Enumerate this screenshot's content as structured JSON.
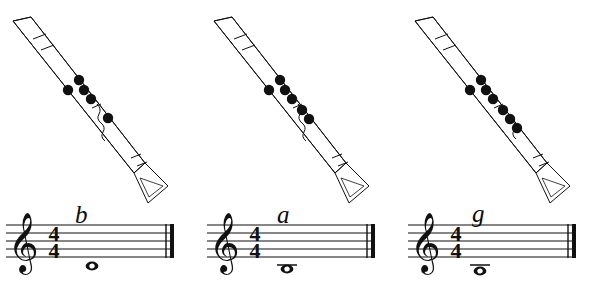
{
  "figure": {
    "background_color": "#ffffff",
    "ink_color": "#111111",
    "panel_count": 3
  },
  "panels": [
    {
      "id": "panel-b",
      "note_letter": "b",
      "staff": {
        "clef": "treble-clef",
        "time_signature_top": "4",
        "time_signature_bottom": "4",
        "note_duration": "whole",
        "note_position": "below-staff",
        "ledger_lines": 0,
        "barline": "final-barline"
      },
      "instrument": {
        "name": "clarinet",
        "covered_hole_count": 5,
        "holes": [
          {
            "id": "thumb",
            "covered": true
          },
          {
            "id": "left-1",
            "covered": true
          },
          {
            "id": "left-2",
            "covered": true
          },
          {
            "id": "left-3",
            "covered": true
          },
          {
            "id": "right-1",
            "covered": true
          }
        ]
      }
    },
    {
      "id": "panel-a",
      "note_letter": "a",
      "staff": {
        "clef": "treble-clef",
        "time_signature_top": "4",
        "time_signature_bottom": "4",
        "note_duration": "whole",
        "note_position": "below-staff",
        "ledger_lines": 1,
        "barline": "final-barline"
      },
      "instrument": {
        "name": "clarinet",
        "covered_hole_count": 6,
        "holes": [
          {
            "id": "thumb",
            "covered": true
          },
          {
            "id": "left-1",
            "covered": true
          },
          {
            "id": "left-2",
            "covered": true
          },
          {
            "id": "left-3",
            "covered": true
          },
          {
            "id": "right-1",
            "covered": true
          },
          {
            "id": "right-2",
            "covered": true
          }
        ]
      }
    },
    {
      "id": "panel-g",
      "note_letter": "g",
      "staff": {
        "clef": "treble-clef",
        "time_signature_top": "4",
        "time_signature_bottom": "4",
        "note_duration": "whole",
        "note_position": "below-staff",
        "ledger_lines": 1,
        "barline": "final-barline"
      },
      "instrument": {
        "name": "clarinet",
        "covered_hole_count": 7,
        "holes": [
          {
            "id": "thumb",
            "covered": true
          },
          {
            "id": "left-1",
            "covered": true
          },
          {
            "id": "left-2",
            "covered": true
          },
          {
            "id": "left-3",
            "covered": true
          },
          {
            "id": "right-1",
            "covered": true
          },
          {
            "id": "right-2",
            "covered": true
          },
          {
            "id": "right-3",
            "covered": true
          }
        ]
      }
    }
  ]
}
